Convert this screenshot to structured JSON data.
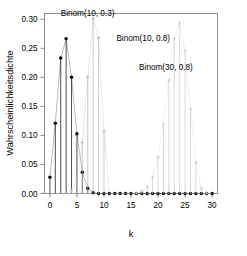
{
  "chart_data": {
    "type": "scatter",
    "title": "",
    "subtitle": "",
    "xlabel": "k",
    "ylabel": "Wahrscheinlichkeitsdichte",
    "xlim": [
      -1,
      31
    ],
    "ylim": [
      0.0,
      0.31
    ],
    "grid": false,
    "legend_position": "inside-annotations",
    "x_ticks": [
      0,
      5,
      10,
      15,
      20,
      25,
      30
    ],
    "x_tick_labels": [
      "0",
      "5",
      "10",
      "15",
      "20",
      "25",
      "30"
    ],
    "x_minor_ticks": [
      1,
      2,
      3,
      4,
      6,
      7,
      8,
      9,
      11,
      12,
      13,
      14,
      16,
      17,
      18,
      19,
      21,
      22,
      23,
      24,
      26,
      27,
      28,
      29
    ],
    "y_ticks": [
      0.0,
      0.05,
      0.1,
      0.15,
      0.2,
      0.25,
      0.3
    ],
    "y_tick_labels": [
      "0.00",
      "0.05",
      "0.10",
      "0.15",
      "0.20",
      "0.25",
      "0.30"
    ],
    "x": [
      0,
      1,
      2,
      3,
      4,
      5,
      6,
      7,
      8,
      9,
      10,
      11,
      12,
      13,
      14,
      15,
      16,
      17,
      18,
      19,
      20,
      21,
      22,
      23,
      24,
      25,
      26,
      27,
      28,
      29,
      30
    ],
    "series": [
      {
        "name": "Binom(10, 0.3)",
        "color": "#000000",
        "marker": "filled-circle",
        "n": 10,
        "p": 0.3,
        "values": [
          0.0282,
          0.1211,
          0.2335,
          0.2668,
          0.2001,
          0.1029,
          0.0368,
          0.009,
          0.0014,
          0.0001,
          0.0,
          0.0,
          0.0,
          0.0,
          0.0,
          0.0,
          0.0,
          0.0,
          0.0,
          0.0,
          0.0,
          0.0,
          0.0,
          0.0,
          0.0,
          0.0,
          0.0,
          0.0,
          0.0,
          0.0,
          0.0
        ]
      },
      {
        "name": "Binom(10, 0.8)",
        "color": "#b4b4b4",
        "marker": "cross",
        "n": 10,
        "p": 0.8,
        "values": [
          0.0,
          0.0,
          0.0001,
          0.0008,
          0.0055,
          0.0264,
          0.088,
          0.2013,
          0.302,
          0.2684,
          0.1074,
          0.0,
          0.0,
          0.0,
          0.0,
          0.0,
          0.0,
          0.0,
          0.0,
          0.0,
          0.0,
          0.0,
          0.0,
          0.0,
          0.0,
          0.0,
          0.0,
          0.0,
          0.0,
          0.0,
          0.0
        ]
      },
      {
        "name": "Binom(30, 0.8)",
        "color": "#c8c8c8",
        "marker": "cross",
        "n": 30,
        "p": 0.8,
        "values": [
          0.0,
          0.0,
          0.0,
          0.0,
          0.0,
          0.0,
          0.0,
          0.0,
          0.0,
          0.0,
          0.0,
          0.0,
          0.0,
          0.0,
          0.0001,
          0.0003,
          0.0012,
          0.0041,
          0.0115,
          0.0286,
          0.0628,
          0.1196,
          0.1954,
          0.2668,
          0.2938,
          0.2464,
          0.1455,
          0.0538,
          0.0093,
          0.0007,
          0.0001
        ]
      }
    ],
    "annotations": [
      {
        "text": "Binom(10, 0.3)",
        "x": 2.0,
        "y": 0.305,
        "color": "#000000"
      },
      {
        "text": "Binom(10, 0.8)",
        "x": 12.3,
        "y": 0.262,
        "color": "#a0a0a0"
      },
      {
        "text": "Binom(30, 0.8)",
        "x": 16.5,
        "y": 0.213,
        "color": "#c0c0c0"
      }
    ]
  },
  "axes": {
    "ylabel": "Wahrscheinlichkeitsdichte",
    "xlabel": "k",
    "y_tick_labels": [
      "0.30",
      "0.25",
      "0.20",
      "0.15",
      "0.10",
      "0.05",
      "0.00"
    ],
    "x_tick_labels": [
      "0",
      "5",
      "10",
      "15",
      "20",
      "25",
      "30"
    ]
  },
  "labels": {
    "series_1": "Binom(10, 0.3)",
    "series_2": "Binom(10, 0.8)",
    "series_3": "Binom(30, 0.8)"
  },
  "colors": {
    "frame": "#8c8c8c",
    "series_1": "#000000",
    "series_2": "#b4b4b4",
    "series_3": "#c8c8c8",
    "background": "#ffffff"
  }
}
